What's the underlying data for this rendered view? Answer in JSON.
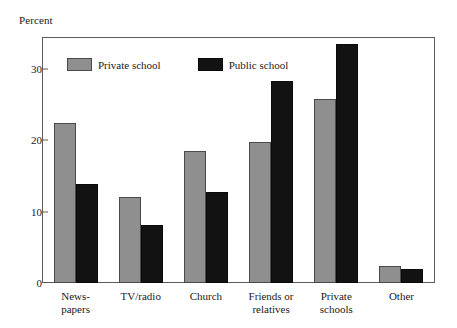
{
  "chart_data": {
    "type": "bar",
    "title": "",
    "ylabel": "Percent",
    "xlabel": "",
    "ylim": [
      0,
      34.3
    ],
    "yticks": [
      0,
      10,
      20,
      30
    ],
    "ytick_labels": [
      "0",
      "10",
      "20",
      "30"
    ],
    "grid": false,
    "legend_position": "top-left inside plot",
    "categories": [
      "News-\npapers",
      "TV/radio",
      "Church",
      "Friends or\nrelatives",
      "Private\nschools",
      "Other"
    ],
    "series": [
      {
        "name": "Private school",
        "color": "#8f8f8f",
        "values": [
          22.4,
          12.1,
          18.5,
          19.7,
          25.7,
          2.4
        ]
      },
      {
        "name": "Public school",
        "color": "#121212",
        "values": [
          13.9,
          8.1,
          12.7,
          28.3,
          33.4,
          2.0
        ]
      }
    ]
  },
  "legend": {
    "items": [
      {
        "label": "Private school",
        "swatch": "private"
      },
      {
        "label": "Public school",
        "swatch": "public"
      }
    ]
  }
}
